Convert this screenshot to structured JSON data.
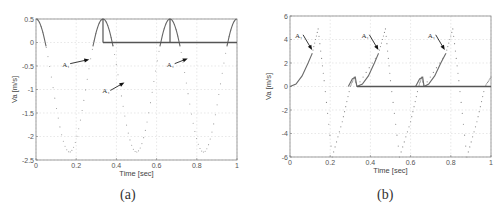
{
  "chart_data": [
    {
      "id": "a",
      "type": "line",
      "caption": "(a)",
      "xlabel": "Time [sec]",
      "ylabel": "Va [m/s]",
      "xlim": [
        0,
        1
      ],
      "ylim": [
        -2.5,
        0.5
      ],
      "xticks": [
        0,
        0.2,
        0.4,
        0.6,
        0.8,
        1
      ],
      "xtick_labels": [
        "0",
        "0.2",
        "0.4",
        "0.6",
        "0.8",
        "1"
      ],
      "yticks": [
        0.5,
        0,
        -0.5,
        -1,
        -1.5,
        -2,
        -2.5
      ],
      "ytick_labels": [
        "0.5",
        "0",
        "-0.5",
        "-1",
        "-1.5",
        "-2",
        "-2.5"
      ],
      "grid": true,
      "legend": null,
      "plot_box_px": {
        "left": 36,
        "top": 19,
        "right": 237,
        "bottom": 160
      },
      "series": [
        {
          "name": "Va (full cycle)",
          "style": "dotted",
          "model": "offset + amp*cos(2*pi*3*t)",
          "offset": -0.915,
          "amp": 1.415,
          "x": [
            0,
            0.05,
            0.1,
            0.1667,
            0.25,
            0.3333,
            0.4,
            0.5,
            0.6,
            0.6667,
            0.75,
            0.8333,
            0.9,
            1
          ],
          "values": [
            0.5,
            -0.03,
            -1.62,
            -2.33,
            -0.92,
            0.5,
            -0.2,
            -2.33,
            -0.2,
            0.5,
            -0.92,
            -2.33,
            -1.62,
            0.5
          ]
        },
        {
          "name": "Va (contact, solid)",
          "style": "solid",
          "x": [
            0,
            0.05,
            0.28,
            0.3333,
            0.38,
            0.61,
            0.6667,
            0.72,
            0.95,
            1
          ],
          "values": [
            0.5,
            -0.03,
            -0.03,
            0.5,
            -0.03,
            -0.03,
            0.5,
            -0.03,
            -0.03,
            0.5
          ]
        },
        {
          "name": "zero baseline",
          "style": "solid-thick",
          "x": [
            0.3333,
            1
          ],
          "values": [
            0,
            0
          ]
        },
        {
          "name": "impulse markers",
          "style": "vertical",
          "x": [
            0.3333,
            0.6667
          ],
          "values": [
            0.5,
            0.5
          ]
        }
      ],
      "annotations": [
        {
          "text": "A₁",
          "label_x": 0.16,
          "label_y": -0.45,
          "arrow_to_x": 0.265,
          "arrow_to_y": -0.36
        },
        {
          "text": "A₁",
          "label_x": 0.36,
          "label_y": -1.02,
          "arrow_to_x": 0.44,
          "arrow_to_y": -0.85
        },
        {
          "text": "A₁",
          "label_x": 0.68,
          "label_y": -0.45,
          "arrow_to_x": 0.755,
          "arrow_to_y": -0.34
        }
      ]
    },
    {
      "id": "b",
      "type": "line",
      "caption": "(b)",
      "xlabel": "Time [sec]",
      "ylabel": "Va [m/s]",
      "xlim": [
        0,
        1
      ],
      "ylim": [
        -6,
        6
      ],
      "xticks": [
        0,
        0.2,
        0.4,
        0.6,
        0.8,
        1
      ],
      "xtick_labels": [
        "0",
        "0.2",
        "0.4",
        "0.6",
        "0.8",
        "1"
      ],
      "yticks": [
        6,
        4,
        2,
        0,
        -2,
        -4,
        -6
      ],
      "ytick_labels": [
        "6",
        "4",
        "2",
        "0",
        "-2",
        "-4",
        "-6"
      ],
      "grid": true,
      "legend": null,
      "plot_box_px": {
        "left": 290,
        "top": 16,
        "right": 491,
        "bottom": 157
      },
      "series": [
        {
          "name": "Va rise (solid)",
          "style": "solid",
          "segments": [
            {
              "x": [
                0,
                0.03,
                0.06,
                0.09,
                0.11
              ],
              "values": [
                0,
                0.2,
                0.9,
                2.0,
                2.8
              ]
            },
            {
              "x": [
                0.333,
                0.36,
                0.39,
                0.42,
                0.44
              ],
              "values": [
                0,
                0.2,
                0.9,
                2.0,
                2.8
              ]
            },
            {
              "x": [
                0.667,
                0.69,
                0.72,
                0.75,
                0.775
              ],
              "values": [
                0,
                0.2,
                0.9,
                2.0,
                2.8
              ]
            }
          ]
        },
        {
          "name": "Va cycle (dotted)",
          "style": "dotted",
          "x": [
            0.11,
            0.14,
            0.17,
            0.21,
            0.26,
            0.3,
            0.32,
            0.333,
            0.44,
            0.475,
            0.5,
            0.545,
            0.6,
            0.64,
            0.655,
            0.667,
            0.775,
            0.81,
            0.84,
            0.88,
            0.93,
            0.97,
            1.0
          ],
          "values": [
            2.8,
            4.9,
            0.5,
            -6.0,
            -3.0,
            0.0,
            0.8,
            0.0,
            2.8,
            4.9,
            0.5,
            -6.0,
            -3.0,
            0.0,
            0.8,
            0.0,
            2.8,
            4.9,
            0.5,
            -6.0,
            -3.0,
            0.0,
            0.8
          ]
        },
        {
          "name": "contact bumps (solid)",
          "style": "solid",
          "segments": [
            {
              "x": [
                0.29,
                0.31,
                0.325,
                0.333
              ],
              "values": [
                0.0,
                0.65,
                0.8,
                0.0
              ]
            },
            {
              "x": [
                0.625,
                0.645,
                0.66,
                0.667
              ],
              "values": [
                0.0,
                0.65,
                0.8,
                0.0
              ]
            }
          ]
        },
        {
          "name": "zero baseline",
          "style": "solid-thick",
          "x": [
            0.333,
            1
          ],
          "values": [
            0,
            0
          ]
        }
      ],
      "annotations": [
        {
          "text": "A₁",
          "label_x": 0.055,
          "label_y": 4.4,
          "arrow_to_x": 0.11,
          "arrow_to_y": 3.1
        },
        {
          "text": "A₁",
          "label_x": 0.385,
          "label_y": 4.4,
          "arrow_to_x": 0.44,
          "arrow_to_y": 3.1
        },
        {
          "text": "A₁",
          "label_x": 0.715,
          "label_y": 4.4,
          "arrow_to_x": 0.77,
          "arrow_to_y": 3.1
        }
      ]
    }
  ]
}
